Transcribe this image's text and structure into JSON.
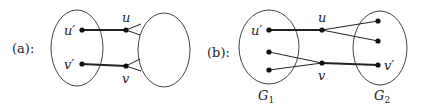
{
  "panels": {
    "a": {
      "label": "(a):",
      "nodes": {
        "u_prime": "u′",
        "v_prime": "v′",
        "u": "u",
        "v": "v"
      }
    },
    "b": {
      "label": "(b):",
      "nodes": {
        "u_prime": "u′",
        "v_prime": "v′",
        "u": "u",
        "v": "v"
      },
      "groups": {
        "g1_base": "G",
        "g1_sub": "1",
        "g2_base": "G",
        "g2_sub": "2"
      }
    }
  },
  "colors": {
    "stroke": "#222222",
    "ellipse": "#444444"
  }
}
